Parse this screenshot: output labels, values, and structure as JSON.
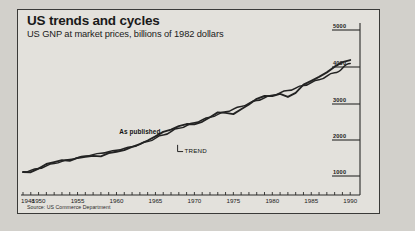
{
  "chart_data": {
    "type": "line",
    "title": "US trends and cycles",
    "subtitle": "US GNP at market prices, billions of 1982 dollars",
    "source": "Source: US Commerce Department",
    "xlabel": "",
    "ylabel": "",
    "xlim": [
      1948,
      1991
    ],
    "ylim": [
      600,
      5000
    ],
    "grid": false,
    "legend_position": "inline-annotation",
    "y_axis_side": "right",
    "yticks": [
      1000,
      2000,
      3000,
      4000,
      5000
    ],
    "ytick_labels": [
      "1000",
      "2000",
      "3000",
      "4000",
      "5000"
    ],
    "xticks": [
      1948,
      1950,
      1955,
      1960,
      1965,
      1970,
      1975,
      1980,
      1985,
      1990
    ],
    "xtick_labels": [
      "1948",
      "1950",
      "1955",
      "1960",
      "1965",
      "1970",
      "1975",
      "1980",
      "1985",
      "1990"
    ],
    "x_minor_tick_interval": 1,
    "annotations": [
      {
        "text": "As published",
        "x": 1963,
        "y": 2150,
        "style": "bold"
      },
      {
        "text": "TREND",
        "x": 1969,
        "y": 1620,
        "style": "plain",
        "leader": true
      }
    ],
    "series": [
      {
        "name": "As published",
        "color": "#232323",
        "x": [
          1948,
          1949,
          1950,
          1951,
          1952,
          1953,
          1954,
          1955,
          1956,
          1957,
          1958,
          1959,
          1960,
          1961,
          1962,
          1963,
          1964,
          1965,
          1966,
          1967,
          1968,
          1969,
          1970,
          1971,
          1972,
          1973,
          1974,
          1975,
          1976,
          1977,
          1978,
          1979,
          1980,
          1981,
          1982,
          1983,
          1984,
          1985,
          1986,
          1987,
          1988,
          1989,
          1990
        ],
        "values": [
          1109,
          1104,
          1204,
          1328,
          1380,
          1435,
          1416,
          1494,
          1525,
          1551,
          1539,
          1629,
          1665,
          1709,
          1799,
          1873,
          1973,
          2087,
          2208,
          2271,
          2366,
          2423,
          2416,
          2485,
          2609,
          2744,
          2729,
          2695,
          2827,
          2959,
          3115,
          3192,
          3187,
          3249,
          3166,
          3279,
          3501,
          3607,
          3714,
          3839,
          3996,
          4118,
          4176
        ]
      },
      {
        "name": "TREND",
        "color": "#232323",
        "x": [
          1948,
          1950,
          1952,
          1954,
          1956,
          1958,
          1960,
          1962,
          1964,
          1966,
          1968,
          1970,
          1972,
          1974,
          1976,
          1978,
          1980,
          1982,
          1984,
          1986,
          1988,
          1990
        ],
        "values": [
          1100,
          1205,
          1345,
          1455,
          1545,
          1625,
          1705,
          1800,
          1945,
          2125,
          2305,
          2460,
          2610,
          2760,
          2905,
          3070,
          3210,
          3340,
          3480,
          3640,
          3830,
          4080
        ]
      }
    ]
  },
  "window": {
    "background_color": "#d2d0cb",
    "panel_color": "#e3e1dc",
    "border_color": "#3a3a38"
  }
}
